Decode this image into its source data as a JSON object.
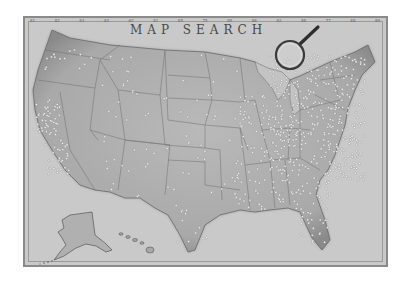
{
  "map": {
    "title": "MAP SEARCH",
    "top_scale": [
      "81",
      "82",
      "83",
      "84",
      "62",
      "81",
      "85",
      "75",
      "85",
      "86",
      "82",
      "88",
      "77",
      "88",
      "89"
    ],
    "colors": {
      "background": "#c9c9c9",
      "land": "#b6b6b6",
      "land_dark": "#8e8e8e",
      "border": "#6e6e6e",
      "pin": "#f4f4f4",
      "frame": "#8a8a8a"
    },
    "icons": {
      "magnifier": "magnifying-glass-icon"
    },
    "regions": [
      "contiguous-us",
      "alaska",
      "hawaii"
    ]
  }
}
